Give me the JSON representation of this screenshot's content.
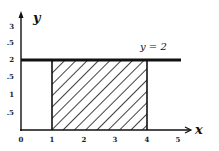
{
  "diagram": {
    "type": "region-plot",
    "x_axis": {
      "label": "x",
      "ticks": [
        "0",
        "1",
        "2",
        "3",
        "4",
        "5"
      ]
    },
    "y_axis": {
      "label": "y",
      "ticks": [
        ".5",
        "1",
        ".5",
        "2",
        ".5",
        "3"
      ]
    },
    "line": {
      "label": "y = 2",
      "equation_y": 2
    },
    "shaded_region": {
      "x_from": 1,
      "x_to": 4,
      "y_from": 0,
      "y_to": 2,
      "fill": "diagonal-hatch"
    },
    "colors": {
      "ink": "#111111",
      "background": "#ffffff"
    }
  }
}
